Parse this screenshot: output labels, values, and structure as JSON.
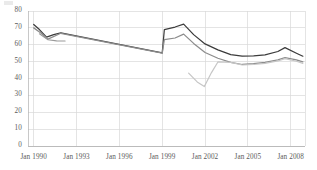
{
  "chart_data": {
    "type": "line",
    "title": "",
    "subtitle": "",
    "xlabel": "",
    "ylabel": "",
    "ylim": [
      0,
      80
    ],
    "ytick_values": [
      0,
      10,
      20,
      30,
      40,
      50,
      60,
      70,
      80
    ],
    "ytick_labels": [
      "0",
      "10",
      "20",
      "30",
      "40",
      "50",
      "60",
      "70",
      "80"
    ],
    "xtick_labels": [
      "Jan 1990",
      "Jan 1993",
      "Jan 1996",
      "Jan 1999",
      "Jan 2002",
      "Jan 2005",
      "Jan 2008"
    ],
    "xtick_values": [
      1990,
      1993,
      1996,
      1999,
      2002,
      2005,
      2008
    ],
    "xlim": [
      1989.6,
      2009.0
    ],
    "grid": true,
    "grid_x": true,
    "grid_y": true,
    "grid_color": "#d9d9d9",
    "legend": false,
    "legend_position": "none",
    "background": "#ffffff",
    "axis_color": "#b0b0b0",
    "tick_text_color": "#5b5b5b",
    "series": [
      {
        "name": "series-dark",
        "color": "#3c3c3c",
        "width": 1.25,
        "x": [
          1990.0,
          1990.4,
          1990.9,
          1991.4,
          1991.9,
          1999.0,
          1999.15,
          1999.9,
          2000.5,
          2001.2,
          2002.0,
          2002.9,
          2003.8,
          2004.6,
          2005.4,
          2006.2,
          2007.1,
          2007.6,
          2008.4,
          2008.85
        ],
        "y": [
          72.0,
          69.0,
          64.5,
          66.0,
          67.0,
          55.2,
          69.0,
          70.5,
          72.2,
          66.0,
          60.5,
          57.0,
          54.2,
          53.2,
          53.4,
          54.0,
          56.0,
          58.3,
          55.0,
          53.2
        ]
      },
      {
        "name": "series-gray",
        "color": "#8c8c8c",
        "width": 1.25,
        "x": [
          1990.0,
          1990.5,
          1991.0,
          1991.9,
          1999.0,
          1999.15,
          1999.9,
          2000.5,
          2001.2,
          2002.0,
          2002.9,
          2003.8,
          2004.6,
          2005.4,
          2006.2,
          2007.1,
          2007.6,
          2008.4,
          2008.85
        ],
        "y": [
          70.0,
          67.0,
          63.3,
          66.8,
          55.0,
          63.0,
          64.0,
          66.3,
          60.8,
          55.4,
          52.0,
          49.6,
          48.3,
          48.8,
          49.5,
          51.0,
          52.4,
          51.0,
          49.9
        ]
      },
      {
        "name": "series-gray-stub",
        "color": "#9a9a9a",
        "width": 1.1,
        "x": [
          1990.4,
          1991.0,
          1991.6,
          1992.2
        ],
        "y": [
          66.5,
          63.0,
          62.3,
          62.2
        ]
      },
      {
        "name": "series-light",
        "color": "#c6c6c6",
        "width": 1.2,
        "x": [
          2000.85,
          2001.45,
          2001.95,
          2002.45,
          2002.9,
          2003.8,
          2004.6,
          2005.4,
          2006.2,
          2007.1,
          2007.6,
          2008.4,
          2008.85
        ],
        "y": [
          43.2,
          38.0,
          35.2,
          43.5,
          49.8,
          49.6,
          48.0,
          48.3,
          49.0,
          50.4,
          51.8,
          50.2,
          49.0
        ]
      }
    ]
  },
  "artifacts": {
    "top_left_smudge": true
  }
}
